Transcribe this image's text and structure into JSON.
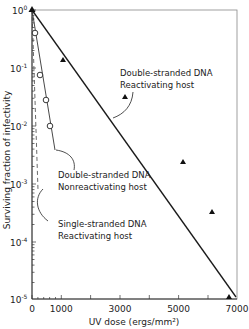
{
  "chart_data": {
    "type": "line",
    "title": "",
    "xlabel": "UV dose (ergs/mm²)",
    "ylabel": "Surviving fraction of infectivity",
    "xlim": [
      0,
      7000
    ],
    "ylim": [
      1e-05,
      1
    ],
    "yscale": "log",
    "grid": false,
    "x_ticks": [
      "0",
      "1000",
      "3000",
      "5000",
      "7000"
    ],
    "y_ticks": [
      "10⁰",
      "10⁻¹",
      "10⁻²",
      "10⁻³",
      "10⁻⁴",
      "10⁻⁵"
    ],
    "series": [
      {
        "name": "Double-stranded DNA Reactivating host",
        "marker": "triangle",
        "line": "solid",
        "points": [
          {
            "x": 0,
            "y": 1.0
          },
          {
            "x": 1000,
            "y": 0.12
          },
          {
            "x": 3100,
            "y": 0.028
          },
          {
            "x": 5100,
            "y": 0.0021
          },
          {
            "x": 6100,
            "y": 0.00029
          },
          {
            "x": 6700,
            "y": 1e-05
          }
        ],
        "fit_line": [
          {
            "x": 0,
            "y": 1.0
          },
          {
            "x": 6900,
            "y": 1e-05
          }
        ]
      },
      {
        "name": "Double-stranded DNA Nonreactivating host",
        "marker": "open-circle",
        "line": "solid",
        "points": [
          {
            "x": 0,
            "y": 1.0
          },
          {
            "x": 100,
            "y": 0.4
          },
          {
            "x": 250,
            "y": 0.075
          },
          {
            "x": 460,
            "y": 0.028
          },
          {
            "x": 600,
            "y": 0.01
          }
        ],
        "fit_line": [
          {
            "x": 0,
            "y": 1.0
          },
          {
            "x": 780,
            "y": 0.0015
          }
        ]
      },
      {
        "name": "Single-stranded DNA Reactivating host",
        "marker": "none",
        "line": "dashed",
        "points": [],
        "fit_line": [
          {
            "x": 0,
            "y": 1.0
          },
          {
            "x": 200,
            "y": 0.0006
          }
        ]
      }
    ],
    "annotations": [
      {
        "text": [
          "Double-stranded DNA",
          "Reactivating host"
        ],
        "target_series": 0
      },
      {
        "text": [
          "Double-stranded DNA",
          "Nonreactivating host"
        ],
        "target_series": 1
      },
      {
        "text": [
          "Single-stranded DNA",
          "Reactivating host"
        ],
        "target_series": 2
      }
    ]
  },
  "labels": {
    "ylabel": "Surviving fraction of infectivity",
    "xlabel": "UV dose (ergs/mm²)",
    "xticks": [
      "0",
      "1000",
      "3000",
      "5000",
      "7000"
    ],
    "ybase": "10",
    "yexp": [
      "0",
      "-1",
      "-2",
      "-3",
      "-4",
      "-5"
    ],
    "annot_ds_react_1": "Double-stranded DNA",
    "annot_ds_react_2": "Reactivating host",
    "annot_ds_nonreact_1": "Double-stranded DNA",
    "annot_ds_nonreact_2": "Nonreactivating host",
    "annot_ss_react_1": "Single-stranded DNA",
    "annot_ss_react_2": "Reactivating host"
  }
}
